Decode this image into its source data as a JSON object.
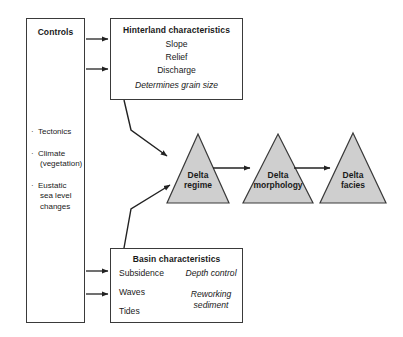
{
  "diagram": {
    "colors": {
      "triangle_fill": "#cfcfcf",
      "stroke": "#3a3a3a",
      "background": "#ffffff",
      "text": "#1a1a1a"
    }
  },
  "controls": {
    "title": "Controls",
    "items": [
      {
        "bullet": "·",
        "label": "Tectonics",
        "sub": ""
      },
      {
        "bullet": "·",
        "label": "Climate",
        "sub": "(vegetation)"
      },
      {
        "bullet": "·",
        "label": "Eustatic",
        "sub": "sea level",
        "sub2": "changes"
      }
    ]
  },
  "hinterland": {
    "title": "Hinterland characteristics",
    "line1": "Slope",
    "line2": "Relief",
    "line3": "Discharge",
    "note": "Determines grain size"
  },
  "basin": {
    "title": "Basin characteristics",
    "left": {
      "subsidence": "Subsidence",
      "waves": "Waves",
      "tides": "Tides"
    },
    "right": {
      "depth_control": "Depth control",
      "reworking": "Reworking sediment"
    }
  },
  "triangles": [
    {
      "name": "delta-regime",
      "line1": "Delta",
      "line2": "regime"
    },
    {
      "name": "delta-morphology",
      "line1": "Delta",
      "line2": "morphology"
    },
    {
      "name": "delta-facies",
      "line1": "Delta",
      "line2": "facies"
    }
  ],
  "arrows": {
    "controls_to_hinterland_1": "Controls → Hinterland characteristics",
    "controls_to_hinterland_2": "Controls → Hinterland characteristics",
    "controls_to_basin_1": "Controls → Basin characteristics",
    "controls_to_basin_2": "Controls → Basin characteristics",
    "hinterland_to_regime": "Hinterland characteristics → Delta regime",
    "basin_to_regime": "Basin characteristics → Delta regime",
    "regime_to_morphology": "Delta regime → Delta morphology",
    "morphology_to_facies": "Delta morphology → Delta facies"
  }
}
